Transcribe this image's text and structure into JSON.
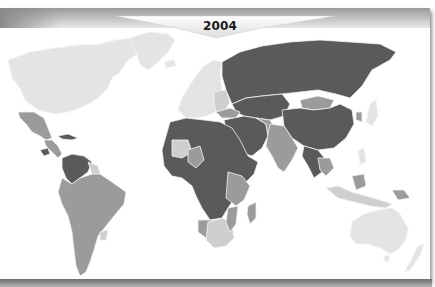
{
  "banner": {
    "year_label": "2004"
  },
  "legend_colors": {
    "lightest": "#e4e4e4",
    "light": "#cfcfcf",
    "medium": "#9b9b9b",
    "dark": "#5a5a5a",
    "border": "#f2f2f2",
    "ocean": "#ffffff"
  },
  "map": {
    "type": "choropleth world map (grayscale)",
    "regions": [
      {
        "name": "North America (Canada, USA)",
        "shade": "lightest"
      },
      {
        "name": "Mexico",
        "shade": "medium"
      },
      {
        "name": "Central America",
        "shade": "medium"
      },
      {
        "name": "Colombia / Venezuela",
        "shade": "dark"
      },
      {
        "name": "South America",
        "shade": "medium"
      },
      {
        "name": "Western Europe",
        "shade": "lightest"
      },
      {
        "name": "Russia",
        "shade": "dark"
      },
      {
        "name": "Central Asia",
        "shade": "dark"
      },
      {
        "name": "Mongolia",
        "shade": "medium"
      },
      {
        "name": "China",
        "shade": "dark"
      },
      {
        "name": "India",
        "shade": "medium"
      },
      {
        "name": "Middle East",
        "shade": "dark"
      },
      {
        "name": "Northern & Central Africa",
        "shade": "dark"
      },
      {
        "name": "East Africa",
        "shade": "medium"
      },
      {
        "name": "Southern Africa",
        "shade": "light"
      },
      {
        "name": "Madagascar",
        "shade": "medium"
      },
      {
        "name": "Southeast Asia",
        "shade": "medium"
      },
      {
        "name": "Australia",
        "shade": "lightest"
      },
      {
        "name": "New Zealand",
        "shade": "lightest"
      },
      {
        "name": "Greenland",
        "shade": "lightest"
      }
    ]
  }
}
